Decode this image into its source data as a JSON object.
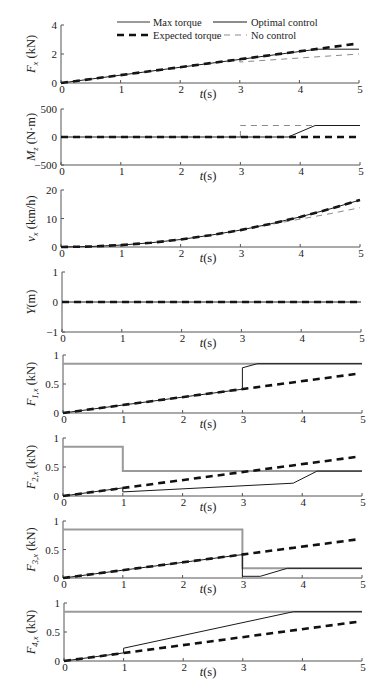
{
  "figure": {
    "legend": [
      {
        "key": "max",
        "label": "Max torque",
        "color": "#9a9a9a",
        "style": "solid thick grey"
      },
      {
        "key": "opt",
        "label": "Optimal control",
        "color": "#1a1a1a",
        "style": "solid thin black"
      },
      {
        "key": "exp",
        "label": "Expected  torque",
        "color": "#111111",
        "style": "dashed thick black"
      },
      {
        "key": "noc",
        "label": "No control",
        "color": "#8a8a8a",
        "style": "dashed thin grey"
      }
    ]
  },
  "chart_data": {
    "type": "line",
    "title": "",
    "legend_position": "top of first panel",
    "grid": false,
    "xlabel": {
      "symbol": "t",
      "unit": "(s)"
    },
    "x_ticks": [
      "0",
      "1",
      "2",
      "3",
      "4",
      "5"
    ],
    "xlim": [
      0,
      5
    ],
    "panels": [
      {
        "id": "Fx",
        "ylabel": {
          "symbol": "F",
          "sub": "x",
          "unit": " (kN)"
        },
        "ylim": [
          0,
          4
        ],
        "yticks": [
          0,
          2,
          4
        ],
        "ytick_labels": [
          "0",
          "2",
          "4"
        ],
        "series": [
          {
            "key": "noc",
            "name": "No control",
            "points": [
              [
                3,
                1.62
              ],
              [
                3,
                1.45
              ],
              [
                5,
                2.0
              ]
            ]
          },
          {
            "key": "exp",
            "name": "Expected torque",
            "points": [
              [
                0,
                0
              ],
              [
                4.95,
                2.7
              ]
            ]
          },
          {
            "key": "opt",
            "name": "Optimal control",
            "points": [
              [
                0,
                0
              ],
              [
                4.3,
                2.33
              ],
              [
                5,
                2.33
              ]
            ]
          }
        ]
      },
      {
        "id": "Mz",
        "ylabel": {
          "symbol": "M",
          "sub": "z",
          "unit": " (N·m)"
        },
        "ylim": [
          -500,
          500
        ],
        "yticks": [
          -500,
          0,
          500
        ],
        "ytick_labels": [
          "−500",
          "0",
          "500"
        ],
        "series": [
          {
            "key": "noc",
            "name": "No control",
            "points": [
              [
                3,
                0
              ],
              [
                3,
                205
              ],
              [
                5,
                205
              ]
            ]
          },
          {
            "key": "exp",
            "name": "Expected torque",
            "points": [
              [
                0,
                0
              ],
              [
                4.95,
                0
              ]
            ]
          },
          {
            "key": "opt",
            "name": "Optimal control",
            "points": [
              [
                0,
                0
              ],
              [
                3.8,
                0
              ],
              [
                4.25,
                205
              ],
              [
                5,
                205
              ]
            ]
          }
        ]
      },
      {
        "id": "vx",
        "ylabel": {
          "symbol": "v",
          "sub": "x",
          "unit": " (km/h)"
        },
        "ylim": [
          0,
          20
        ],
        "yticks": [
          0,
          10,
          20
        ],
        "ytick_labels": [
          "0",
          "10",
          "20"
        ],
        "series": [
          {
            "key": "noc",
            "name": "No control",
            "points": [
              [
                3,
                5.94
              ],
              [
                3.5,
                7.9
              ],
              [
                4,
                9.8
              ],
              [
                4.5,
                11.7
              ],
              [
                5,
                13.8
              ]
            ]
          },
          {
            "key": "exp",
            "name": "Expected torque",
            "points": [
              [
                0,
                0
              ],
              [
                0.5,
                0.17
              ],
              [
                1,
                0.66
              ],
              [
                1.5,
                1.49
              ],
              [
                2,
                2.64
              ],
              [
                2.5,
                4.13
              ],
              [
                3,
                5.94
              ],
              [
                3.5,
                8.09
              ],
              [
                4,
                10.56
              ],
              [
                4.5,
                13.37
              ],
              [
                5,
                16.5
              ]
            ]
          },
          {
            "key": "opt",
            "name": "Optimal control",
            "points": [
              [
                0,
                0
              ],
              [
                0.5,
                0.17
              ],
              [
                1,
                0.66
              ],
              [
                1.5,
                1.49
              ],
              [
                2,
                2.64
              ],
              [
                2.5,
                4.13
              ],
              [
                3,
                5.94
              ],
              [
                3.5,
                8.09
              ],
              [
                4,
                10.56
              ],
              [
                4.5,
                13.37
              ],
              [
                5,
                16.5
              ]
            ]
          }
        ]
      },
      {
        "id": "Y",
        "ylabel": {
          "symbol": "Y",
          "sub": "",
          "unit": "(m)"
        },
        "ylim": [
          -1,
          1
        ],
        "yticks": [
          -1,
          0,
          1
        ],
        "ytick_labels": [
          "−1",
          "0",
          "1"
        ],
        "series": [
          {
            "key": "exp",
            "name": "Expected torque",
            "points": [
              [
                0,
                0
              ],
              [
                4.95,
                0
              ]
            ]
          },
          {
            "key": "opt",
            "name": "Optimal control",
            "points": [
              [
                0,
                0
              ],
              [
                5,
                0
              ]
            ]
          }
        ]
      },
      {
        "id": "F1x",
        "ylabel": {
          "symbol": "F",
          "sub": "1,x",
          "unit": " (kN)"
        },
        "ylim": [
          0,
          1
        ],
        "yticks": [
          0,
          0.5,
          1
        ],
        "ytick_labels": [
          "0",
          "0.5",
          "1"
        ],
        "series": [
          {
            "key": "max",
            "name": "Max torque",
            "points": [
              [
                0,
                0.85
              ],
              [
                5,
                0.85
              ]
            ]
          },
          {
            "key": "exp",
            "name": "Expected torque",
            "points": [
              [
                0,
                0
              ],
              [
                4.95,
                0.68
              ]
            ]
          },
          {
            "key": "opt",
            "name": "Optimal control",
            "points": [
              [
                0,
                0
              ],
              [
                3,
                0.41
              ],
              [
                3,
                0.78
              ],
              [
                3.25,
                0.85
              ],
              [
                5,
                0.85
              ]
            ]
          }
        ]
      },
      {
        "id": "F2x",
        "ylabel": {
          "symbol": "F",
          "sub": "2,x",
          "unit": " (kN)"
        },
        "ylim": [
          0,
          1
        ],
        "yticks": [
          0,
          0.5,
          1
        ],
        "ytick_labels": [
          "0",
          "0.5",
          "1"
        ],
        "series": [
          {
            "key": "max",
            "name": "Max torque",
            "points": [
              [
                0,
                0.85
              ],
              [
                1,
                0.85
              ],
              [
                1,
                0.43
              ],
              [
                5,
                0.43
              ]
            ]
          },
          {
            "key": "exp",
            "name": "Expected torque",
            "points": [
              [
                0,
                0
              ],
              [
                4.95,
                0.68
              ]
            ]
          },
          {
            "key": "opt",
            "name": "Optimal control",
            "points": [
              [
                0,
                0
              ],
              [
                1,
                0.14
              ],
              [
                1,
                0.07
              ],
              [
                3.85,
                0.22
              ],
              [
                4.25,
                0.43
              ],
              [
                5,
                0.43
              ]
            ]
          }
        ]
      },
      {
        "id": "F3x",
        "ylabel": {
          "symbol": "F",
          "sub": "3,x",
          "unit": " (kN)"
        },
        "ylim": [
          0,
          1
        ],
        "yticks": [
          0,
          0.5,
          1
        ],
        "ytick_labels": [
          "0",
          "0.5",
          "1"
        ],
        "series": [
          {
            "key": "max",
            "name": "Max torque",
            "points": [
              [
                0,
                0.85
              ],
              [
                3,
                0.85
              ],
              [
                3,
                0.17
              ],
              [
                5,
                0.17
              ]
            ]
          },
          {
            "key": "exp",
            "name": "Expected torque",
            "points": [
              [
                0,
                0
              ],
              [
                4.95,
                0.68
              ]
            ]
          },
          {
            "key": "opt",
            "name": "Optimal control",
            "points": [
              [
                0,
                0
              ],
              [
                3,
                0.41
              ],
              [
                3,
                0.03
              ],
              [
                3.3,
                0.03
              ],
              [
                3.75,
                0.17
              ],
              [
                5,
                0.17
              ]
            ]
          }
        ]
      },
      {
        "id": "F4x",
        "ylabel": {
          "symbol": "F",
          "sub": "4,x",
          "unit": " (kN)"
        },
        "ylim": [
          0,
          1
        ],
        "yticks": [
          0,
          0.5,
          1
        ],
        "ytick_labels": [
          "0",
          "0.5",
          "1"
        ],
        "series": [
          {
            "key": "max",
            "name": "Max torque",
            "points": [
              [
                0,
                0.85
              ],
              [
                5,
                0.85
              ]
            ]
          },
          {
            "key": "exp",
            "name": "Expected torque",
            "points": [
              [
                0,
                0
              ],
              [
                4.95,
                0.68
              ]
            ]
          },
          {
            "key": "opt",
            "name": "Optimal control",
            "points": [
              [
                0,
                0
              ],
              [
                1,
                0.14
              ],
              [
                1,
                0.22
              ],
              [
                3.85,
                0.85
              ],
              [
                5,
                0.85
              ]
            ]
          }
        ]
      }
    ]
  }
}
